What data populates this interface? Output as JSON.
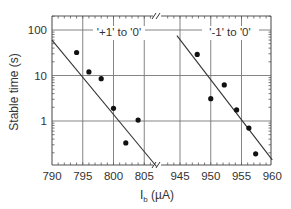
{
  "chart_data": {
    "type": "scatter",
    "title": "",
    "xlabel": "I_b (µA)",
    "xlabel_main": "I",
    "xlabel_sub": "b",
    "xlabel_unit": " (µA)",
    "ylabel": "Stable time (s)",
    "yscale": "log",
    "ylim": [
      0.1,
      200
    ],
    "y_ticks": [
      1,
      10,
      100
    ],
    "y_tick_labels": [
      "1",
      "10",
      "100"
    ],
    "grid": true,
    "broken_x_axis": true,
    "panels": [
      {
        "label": "'+1' to '0'",
        "xlim": [
          790,
          807
        ],
        "x_ticks": [
          790,
          795,
          800,
          805
        ],
        "x_tick_labels": [
          "790",
          "795",
          "800",
          "805"
        ],
        "points": [
          {
            "x": 794,
            "y": 32
          },
          {
            "x": 796,
            "y": 12
          },
          {
            "x": 798,
            "y": 8.5
          },
          {
            "x": 800,
            "y": 1.9
          },
          {
            "x": 802,
            "y": 0.33
          },
          {
            "x": 804,
            "y": 1.05
          }
        ],
        "fit_line": {
          "x1": 790,
          "y1": 60,
          "x2": 807,
          "y2": 0.1
        }
      },
      {
        "label": "'-1' to '0'",
        "xlim": [
          943,
          960
        ],
        "x_ticks": [
          945,
          950,
          955,
          960
        ],
        "x_tick_labels": [
          "945",
          "950",
          "955",
          "960"
        ],
        "points": [
          {
            "x": 947.8,
            "y": 29
          },
          {
            "x": 950,
            "y": 3.1
          },
          {
            "x": 952.2,
            "y": 6.2
          },
          {
            "x": 954.2,
            "y": 1.75
          },
          {
            "x": 956.2,
            "y": 0.7
          },
          {
            "x": 957.3,
            "y": 0.19
          }
        ],
        "fit_line": {
          "x1": 944.5,
          "y1": 75,
          "x2": 960,
          "y2": 0.14
        }
      }
    ]
  }
}
